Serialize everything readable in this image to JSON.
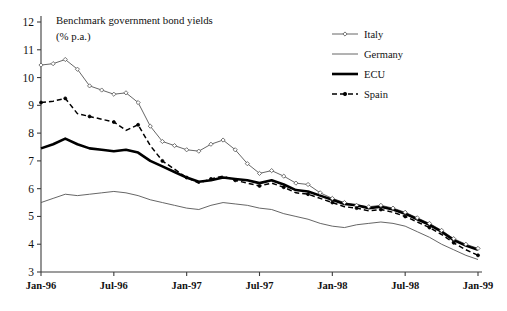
{
  "chart_data": {
    "type": "line",
    "title": "Benchmark government bond yields",
    "subtitle": "(% p.a.)",
    "xlabel": "",
    "ylabel": "",
    "ylim": [
      3,
      12
    ],
    "ytick_values": [
      3,
      4,
      5,
      6,
      7,
      8,
      9,
      10,
      11,
      12
    ],
    "ytick_labels": [
      "3",
      "4",
      "5",
      "6",
      "7",
      "8",
      "9",
      "10",
      "11",
      "12"
    ],
    "xtick_labels": [
      "Jan-96",
      "Jul-96",
      "Jan-97",
      "Jul-97",
      "Jan-98",
      "Jul-98",
      "Jan-99"
    ],
    "xtick_index": [
      0,
      6,
      12,
      18,
      24,
      30,
      36
    ],
    "grid": false,
    "legend_position": "top-right",
    "x": [
      "Jan-96",
      "Feb-96",
      "Mar-96",
      "Apr-96",
      "May-96",
      "Jun-96",
      "Jul-96",
      "Aug-96",
      "Sep-96",
      "Oct-96",
      "Nov-96",
      "Dec-96",
      "Jan-97",
      "Feb-97",
      "Mar-97",
      "Apr-97",
      "May-97",
      "Jun-97",
      "Jul-97",
      "Aug-97",
      "Sep-97",
      "Oct-97",
      "Nov-97",
      "Dec-97",
      "Jan-98",
      "Feb-98",
      "Mar-98",
      "Apr-98",
      "May-98",
      "Jun-98",
      "Jul-98",
      "Aug-98",
      "Sep-98",
      "Oct-98",
      "Nov-98",
      "Dec-98",
      "Jan-99"
    ],
    "series": [
      {
        "name": "Italy",
        "style": "thin-line-with-open-diamond-markers",
        "color": "#555555",
        "values": [
          10.45,
          10.5,
          10.65,
          10.3,
          9.7,
          9.55,
          9.4,
          9.45,
          9.1,
          8.25,
          7.7,
          7.55,
          7.4,
          7.35,
          7.6,
          7.75,
          7.4,
          6.9,
          6.55,
          6.65,
          6.45,
          6.2,
          6.15,
          5.85,
          5.65,
          5.5,
          5.4,
          5.35,
          5.4,
          5.3,
          5.15,
          4.95,
          4.75,
          4.5,
          4.2,
          4.0,
          3.85
        ]
      },
      {
        "name": "Germany",
        "style": "thin-plain-line",
        "color": "#555555",
        "values": [
          5.5,
          5.65,
          5.8,
          5.75,
          5.8,
          5.85,
          5.9,
          5.85,
          5.75,
          5.6,
          5.5,
          5.4,
          5.3,
          5.25,
          5.4,
          5.5,
          5.45,
          5.4,
          5.3,
          5.25,
          5.1,
          5.0,
          4.9,
          4.75,
          4.65,
          4.6,
          4.7,
          4.75,
          4.8,
          4.75,
          4.65,
          4.45,
          4.25,
          4.0,
          3.8,
          3.6,
          3.45
        ]
      },
      {
        "name": "ECU",
        "style": "thick-black-line",
        "color": "#000000",
        "values": [
          7.45,
          7.6,
          7.8,
          7.6,
          7.45,
          7.4,
          7.35,
          7.4,
          7.3,
          7.0,
          6.8,
          6.6,
          6.4,
          6.25,
          6.3,
          6.4,
          6.35,
          6.3,
          6.2,
          6.3,
          6.15,
          5.95,
          5.9,
          5.75,
          5.6,
          5.45,
          5.4,
          5.3,
          5.35,
          5.25,
          5.1,
          4.9,
          4.7,
          4.45,
          4.15,
          3.95,
          3.8
        ]
      },
      {
        "name": "Spain",
        "style": "dashed-line-with-markers",
        "color": "#000000",
        "values": [
          9.1,
          9.15,
          9.25,
          8.7,
          8.6,
          8.5,
          8.4,
          8.1,
          8.3,
          7.55,
          7.0,
          6.7,
          6.4,
          6.2,
          6.35,
          6.45,
          6.3,
          6.2,
          6.1,
          6.2,
          6.05,
          5.85,
          5.8,
          5.65,
          5.5,
          5.35,
          5.3,
          5.2,
          5.25,
          5.15,
          5.0,
          4.8,
          4.6,
          4.35,
          4.05,
          3.8,
          3.6
        ]
      }
    ]
  },
  "legend": {
    "items": [
      {
        "label": "Italy"
      },
      {
        "label": "Germany"
      },
      {
        "label": "ECU"
      },
      {
        "label": "Spain"
      }
    ]
  }
}
